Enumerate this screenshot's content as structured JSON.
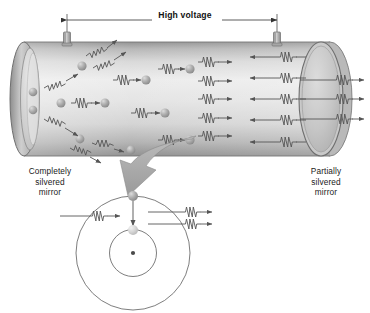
{
  "figure": {
    "type": "physics-diagram",
    "width": 370,
    "height": 313
  },
  "labels": {
    "high_voltage": "High voltage",
    "left_mirror": [
      "Completely",
      "silvered",
      "mirror"
    ],
    "right_mirror": [
      "Partially",
      "silvered",
      "mirror"
    ]
  },
  "colors": {
    "background": "#ffffff",
    "tube_light": "#e9e9e9",
    "tube_mid": "#cfcfcf",
    "tube_dark": "#9a9a9a",
    "tube_edge": "#7d7d7d",
    "mirror_face": "#c2c2c2",
    "mirror_rim": "#a8a8a8",
    "atom_light": "#d8d8d8",
    "atom_dark": "#9d9d9d",
    "line": "#555555",
    "text": "#1a1a1a",
    "callout_arrow": "#9c9c9c"
  },
  "tube": {
    "left_end_x": 14,
    "right_end_x": 330,
    "top_y": 46,
    "bottom_y": 152,
    "description": "Cut-away cylindrical gas discharge tube shown in perspective"
  },
  "electrodes": [
    {
      "name": "left-electrode",
      "x": 67,
      "y": 36
    },
    {
      "name": "right-electrode",
      "x": 277,
      "y": 36
    }
  ],
  "dimension_line": {
    "label": "High voltage",
    "x_start": 66,
    "x_end": 277,
    "y": 20,
    "arrowheads": "both"
  },
  "mirrors": {
    "left": {
      "type": "completely-silvered",
      "cx": 24,
      "cy": 99,
      "rx": 13,
      "ry": 53
    },
    "right": {
      "type": "partially-silvered",
      "cx": 320,
      "cy": 99,
      "rx": 21,
      "ry": 56
    }
  },
  "emission_regions": {
    "left_random": {
      "description": "Spontaneous emission - photons travel in random directions",
      "atom_count": 8
    },
    "right_aligned": {
      "description": "Stimulated emission - photons aligned along tube axis",
      "beam_rows": 5
    }
  },
  "output_beams": {
    "count": 3,
    "direction": "right",
    "description": "Coherent laser light exits the partially silvered mirror"
  },
  "atom_inset": {
    "center": {
      "x": 133,
      "y": 253
    },
    "outer_orbit_r": 57,
    "inner_orbit_r": 23,
    "nucleus": {
      "x": 133,
      "y": 253,
      "r": 2
    },
    "electron_start": {
      "x": 133,
      "y": 196,
      "state": "excited-outer-orbit"
    },
    "electron_end": {
      "x": 133,
      "y": 230,
      "state": "ground-inner-orbit"
    },
    "incoming_photon": {
      "count": 1,
      "direction": "right"
    },
    "outgoing_photons": {
      "count": 2,
      "direction": "right"
    },
    "description": "Stimulated emission: one incident photon triggers the electron to drop an orbit, releasing a second identical photon"
  },
  "callout": {
    "description": "Curved block arrow linking tube interior to the atom detail",
    "from": {
      "x": 196,
      "y": 142
    },
    "to": {
      "x": 133,
      "y": 196
    }
  }
}
